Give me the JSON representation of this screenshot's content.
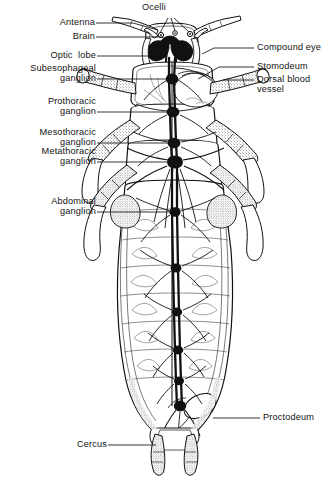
{
  "figure": {
    "view": "dorsal",
    "background_color": "#ffffff",
    "ink_color": "#111111",
    "width": 332,
    "height": 477
  },
  "labels": [
    {
      "id": "ocelli",
      "text": "Ocelli",
      "side": "top",
      "align": "center",
      "x": 154,
      "y": 2,
      "leader_lines": [
        [
          [
            168,
            19
          ],
          [
            160,
            34
          ]
        ],
        [
          [
            171,
            19
          ],
          [
            175,
            33
          ]
        ],
        [
          [
            174,
            19
          ],
          [
            190,
            32
          ]
        ]
      ]
    },
    {
      "id": "antenna",
      "text": "Antenna",
      "side": "left",
      "align": "right",
      "x": 47,
      "y": 18,
      "leader_lines": [
        [
          [
            96,
            23
          ],
          [
            132,
            23
          ],
          [
            158,
            29
          ]
        ]
      ]
    },
    {
      "id": "brain",
      "text": "Brain",
      "side": "left",
      "align": "right",
      "x": 63,
      "y": 32,
      "leader_lines": [
        [
          [
            96,
            37
          ],
          [
            163,
            37
          ],
          [
            170,
            43
          ]
        ]
      ]
    },
    {
      "id": "optic-lobe",
      "text": "Optic  lobe",
      "side": "left",
      "align": "right",
      "x": 36,
      "y": 52,
      "leader_lines": [
        [
          [
            97,
            56
          ],
          [
            157,
            56
          ]
        ]
      ]
    },
    {
      "id": "subesophageal-ganglion",
      "text": "Subesophageal\nganglion",
      "side": "left",
      "align": "right",
      "x": 10,
      "y": 64,
      "leader_lines": [
        [
          [
            97,
            79
          ],
          [
            171,
            79
          ]
        ]
      ]
    },
    {
      "id": "prothoracic-ganglion",
      "text": "Prothoracic\nganglion",
      "side": "left",
      "align": "right",
      "x": 26,
      "y": 98,
      "leader_lines": [
        [
          [
            97,
            112
          ],
          [
            172,
            112
          ]
        ]
      ]
    },
    {
      "id": "mesothoracic-ganglion",
      "text": "Mesothoracic\nganglion",
      "side": "left",
      "align": "right",
      "x": 16,
      "y": 130,
      "leader_lines": [
        [
          [
            97,
            143
          ],
          [
            173,
            143
          ]
        ]
      ]
    },
    {
      "id": "metathoracic-ganglion",
      "text": "Metathoracic\nganglion",
      "side": "left",
      "align": "right",
      "x": 16,
      "y": 149,
      "leader_lines": [
        [
          [
            97,
            162
          ],
          [
            174,
            162
          ]
        ]
      ]
    },
    {
      "id": "abdominal-ganglion",
      "text": "Abdominal\nganglion",
      "side": "left",
      "align": "right",
      "x": 27,
      "y": 199,
      "leader_lines": [
        [
          [
            97,
            212
          ],
          [
            174,
            212
          ]
        ]
      ]
    },
    {
      "id": "cercus",
      "text": "Cercus",
      "side": "left",
      "align": "right",
      "x": 62,
      "y": 440,
      "leader_lines": [
        [
          [
            108,
            445
          ],
          [
            155,
            445
          ]
        ]
      ]
    },
    {
      "id": "compound-eye",
      "text": "Compound eye",
      "side": "right",
      "align": "left",
      "x": 257,
      "y": 43,
      "leader_lines": [
        [
          [
            253,
            48
          ],
          [
            215,
            48
          ],
          [
            205,
            53
          ]
        ]
      ]
    },
    {
      "id": "stomodeum",
      "text": "Stomodeum",
      "side": "right",
      "align": "left",
      "x": 257,
      "y": 62,
      "leader_lines": [
        [
          [
            253,
            67
          ],
          [
            218,
            67
          ],
          [
            196,
            80
          ]
        ]
      ]
    },
    {
      "id": "dorsal-blood-vessel",
      "text": "Dorsal blood\nvessel",
      "side": "right",
      "align": "left",
      "x": 257,
      "y": 75,
      "leader_lines": [
        [
          [
            253,
            80
          ],
          [
            222,
            80
          ]
        ]
      ]
    },
    {
      "id": "proctodeum",
      "text": "Proctodeum",
      "side": "right",
      "align": "left",
      "x": 263,
      "y": 413,
      "leader_lines": [
        [
          [
            259,
            418
          ],
          [
            212,
            418
          ]
        ]
      ]
    }
  ],
  "anatomy": {
    "ganglia_chain": [
      {
        "name": "brain",
        "cx": 170,
        "cy": 38,
        "r": 3.2
      },
      {
        "name": "subesophageal-ganglion",
        "cx": 171,
        "cy": 79,
        "r": 5.0
      },
      {
        "name": "prothoracic-ganglion",
        "cx": 172,
        "cy": 112,
        "r": 5.2
      },
      {
        "name": "mesothoracic-ganglion",
        "cx": 173,
        "cy": 143,
        "r": 5.2
      },
      {
        "name": "metathoracic-ganglion",
        "cx": 174,
        "cy": 162,
        "r": 6.4
      },
      {
        "name": "abdominal-ganglion-1",
        "cx": 174,
        "cy": 212,
        "r": 4.6
      },
      {
        "name": "abdominal-ganglion-2",
        "cx": 175,
        "cy": 268,
        "r": 4.4
      },
      {
        "name": "abdominal-ganglion-3",
        "cx": 176,
        "cy": 312,
        "r": 4.2
      },
      {
        "name": "abdominal-ganglion-4",
        "cx": 177,
        "cy": 350,
        "r": 4.2
      },
      {
        "name": "abdominal-ganglion-5",
        "cx": 178,
        "cy": 381,
        "r": 4.0
      },
      {
        "name": "terminal-ganglion",
        "cx": 179,
        "cy": 406,
        "r": 5.0
      }
    ],
    "segments": [
      "head",
      "prothorax",
      "mesothorax",
      "metathorax",
      "abdomen-1",
      "abdomen-2",
      "abdomen-3",
      "abdomen-4",
      "abdomen-5",
      "abdomen-6",
      "abdomen-7",
      "terminal"
    ],
    "appendages": [
      "antennae",
      "compound-eyes",
      "ocelli",
      "prothoracic-legs",
      "mesothoracic-legs",
      "metathoracic-legs",
      "cerci"
    ]
  }
}
